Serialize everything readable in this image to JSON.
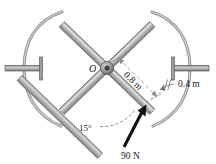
{
  "figure": {
    "center_label": "O",
    "dimensions": [
      {
        "id": "radius_outer",
        "label": "0.8 m"
      },
      {
        "id": "offset",
        "label": "0.4 m"
      }
    ],
    "angle": {
      "label": "15°"
    },
    "force": {
      "label": "90 N"
    },
    "colors": {
      "spoke_fill": "#b9b9b9",
      "spoke_edge": "#6e6e6e",
      "arc_stroke": "#8a8a8a",
      "axle_fill": "#9a9a9a",
      "axle_edge": "#5a5a5a",
      "hub_fill": "#555555",
      "dim_line": "#8c8c8c",
      "force_arrow": "#111111",
      "text": "#1a1a1a",
      "background": "#ffffff"
    }
  }
}
